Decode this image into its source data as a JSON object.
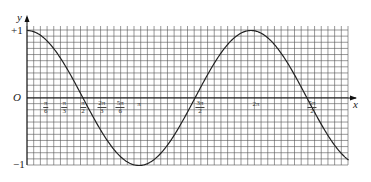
{
  "chart_data": {
    "type": "line",
    "title": "",
    "xlabel": "x",
    "ylabel": "y",
    "function": "y = cos(x)",
    "origin_label": "O",
    "y_tick_labels": [
      "+1",
      "-1"
    ],
    "ylim": [
      -1,
      1
    ],
    "xlim": [
      0,
      8.98
    ],
    "grid": true,
    "x_tick_labels": [
      {
        "num": "π",
        "den": "6",
        "value": 0.5236
      },
      {
        "num": "π",
        "den": "3",
        "value": 1.0472
      },
      {
        "num": "π",
        "den": "2",
        "value": 1.5708
      },
      {
        "num": "2π",
        "den": "3",
        "value": 2.0944
      },
      {
        "num": "5π",
        "den": "6",
        "value": 2.618
      },
      {
        "num": "π",
        "den": "",
        "value": 3.1416
      },
      {
        "num": "3π",
        "den": "2",
        "value": 4.7124
      },
      {
        "num": "2π",
        "den": "",
        "value": 6.2832
      },
      {
        "num": "5π",
        "den": "2",
        "value": 7.854
      }
    ],
    "key_points": [
      {
        "x": 0,
        "y": 1
      },
      {
        "x": 1.5708,
        "y": 0
      },
      {
        "x": 3.1416,
        "y": -1
      },
      {
        "x": 4.7124,
        "y": 0
      },
      {
        "x": 6.2832,
        "y": 1
      },
      {
        "x": 7.854,
        "y": 0
      },
      {
        "x": 8.98,
        "y": -0.9
      }
    ]
  },
  "labels": {
    "y_axis": "y",
    "x_axis": "x",
    "origin": "O",
    "plus_one": "+1",
    "minus_one": "−1"
  },
  "colors": {
    "grid": "#555555",
    "curve": "#222222",
    "axis": "#111111"
  }
}
